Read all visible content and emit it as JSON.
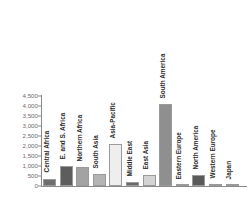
{
  "chart_data": {
    "type": "bar",
    "title": "",
    "subtitle": "",
    "xlabel": "",
    "ylabel": "",
    "ylim": [
      0,
      4500
    ],
    "ytick_step": 500,
    "grid": false,
    "legend": false,
    "orientation": "vertical",
    "label_rotation": -90,
    "ytick_labels": [
      "0",
      "500",
      "1,000",
      "1,500",
      "2,000",
      "2,500",
      "3,000",
      "3,500",
      "4,000",
      "4,500"
    ],
    "ytick_values": [
      0,
      500,
      1000,
      1500,
      2000,
      2500,
      3000,
      3500,
      4000,
      4500
    ],
    "categories": [
      "Central Africa",
      "E. and S. Africa",
      "Northern Africa",
      "South Asia",
      "Asia-Pacific",
      "Middle East",
      "East Asia",
      "South America",
      "Eastern Europe",
      "North America",
      "Western Europe",
      "Japan"
    ],
    "values": [
      370,
      1020,
      930,
      580,
      2100,
      190,
      550,
      4100,
      20,
      540,
      90,
      10
    ],
    "bar_colors": [
      "#6e6e6e",
      "#5d5d5d",
      "#a3a3a3",
      "#b4b4b4",
      "#eeeeee",
      "#6b6b6b",
      "#d3d3d3",
      "#8f8f8f",
      "#7a7a7a",
      "#5a5a5a",
      "#c9c9c9",
      "#9b9b9b"
    ]
  },
  "style": {
    "axis_color": "#8a8a8a",
    "tick_label_color": "#6b6b6b",
    "category_label_color": "#2b2b2b",
    "background": "#ffffff"
  }
}
